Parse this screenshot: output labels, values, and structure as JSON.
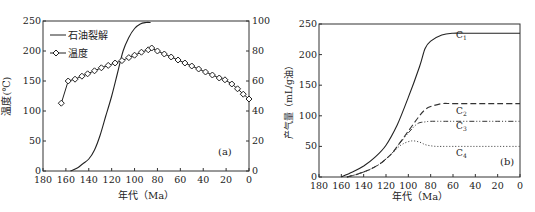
{
  "chart_data": [
    {
      "type": "line",
      "panel_label": "(a)",
      "title": "",
      "xlabel": "年代（Ma）",
      "ylabel": "温度(℃)",
      "ylabel_right": "石油裂解率(%)",
      "xlim": [
        180,
        0
      ],
      "ylim": [
        0,
        250
      ],
      "ylim_right": [
        0,
        100
      ],
      "x_ticks": [
        180,
        160,
        140,
        120,
        100,
        80,
        60,
        40,
        20,
        0
      ],
      "y_ticks": [
        0,
        50,
        100,
        150,
        200,
        250
      ],
      "y_ticks_right": [
        0,
        20,
        40,
        60,
        80,
        100
      ],
      "legend": [
        "石油裂解",
        "温度"
      ],
      "legend_position": "upper left",
      "series": [
        {
          "name": "石油裂解",
          "axis": "right",
          "style": "solid",
          "x": [
            156,
            150,
            145,
            140,
            135,
            130,
            125,
            120,
            115,
            110,
            105,
            100,
            95,
            90,
            86
          ],
          "values": [
            0,
            2,
            5,
            8,
            14,
            24,
            37,
            50,
            65,
            80,
            89,
            95,
            98,
            99,
            99
          ]
        },
        {
          "name": "温度",
          "axis": "left",
          "style": "solid-diamond-markers",
          "x": [
            164,
            158,
            152,
            146,
            141,
            135,
            129,
            123,
            117,
            111,
            105,
            100,
            94,
            88,
            85,
            80,
            74,
            68,
            62,
            56,
            50,
            44,
            38,
            32,
            26,
            21,
            15,
            10,
            5,
            0
          ],
          "values": [
            113,
            150,
            153,
            158,
            162,
            167,
            172,
            176,
            180,
            184,
            189,
            193,
            198,
            202,
            205,
            200,
            195,
            190,
            185,
            180,
            175,
            170,
            165,
            160,
            155,
            152,
            145,
            137,
            128,
            120
          ]
        }
      ]
    },
    {
      "type": "line",
      "panel_label": "(b)",
      "title": "",
      "xlabel": "年代（Ma）",
      "ylabel": "产气量（mL/g油）",
      "xlim": [
        180,
        0
      ],
      "ylim": [
        0,
        250
      ],
      "x_ticks": [
        180,
        160,
        140,
        120,
        100,
        80,
        60,
        40,
        20,
        0
      ],
      "y_ticks": [
        0,
        50,
        100,
        150,
        200,
        250
      ],
      "series": [
        {
          "name": "C1",
          "style": "solid",
          "x": [
            160,
            150,
            140,
            130,
            120,
            110,
            100,
            90,
            85,
            80,
            70,
            60,
            50,
            40,
            20,
            0
          ],
          "values": [
            0,
            8,
            18,
            32,
            52,
            85,
            130,
            180,
            210,
            222,
            232,
            235,
            235,
            235,
            235,
            235
          ]
        },
        {
          "name": "C2",
          "style": "dashed",
          "x": [
            155,
            145,
            135,
            125,
            115,
            110,
            100,
            90,
            85,
            80,
            70,
            60,
            40,
            20,
            0
          ],
          "values": [
            0,
            5,
            12,
            22,
            38,
            50,
            75,
            100,
            110,
            115,
            120,
            120,
            120,
            120,
            120
          ]
        },
        {
          "name": "C3",
          "style": "dash-dot-dot",
          "x": [
            155,
            145,
            135,
            125,
            115,
            110,
            100,
            92,
            85,
            80,
            70,
            60,
            40,
            20,
            0
          ],
          "values": [
            0,
            5,
            12,
            22,
            38,
            50,
            72,
            87,
            90,
            91,
            91,
            91,
            91,
            91,
            91
          ]
        },
        {
          "name": "C4",
          "style": "dotted",
          "x": [
            155,
            145,
            135,
            125,
            115,
            110,
            105,
            97,
            90,
            85,
            80,
            75,
            70,
            60,
            40,
            20,
            0
          ],
          "values": [
            0,
            5,
            12,
            22,
            38,
            47,
            54,
            59,
            57,
            53,
            51,
            50,
            50,
            50,
            50,
            50,
            50
          ]
        }
      ]
    }
  ],
  "panels": {
    "a": {
      "label": "(a)",
      "xlabel": "年代（Ma）",
      "ylabel": "温度(℃)",
      "ylabel_right": "石油裂解率(%)",
      "legend": {
        "oil": "石油裂解",
        "temp": "温度"
      }
    },
    "b": {
      "label": "(b)",
      "xlabel": "年代（Ma）",
      "ylabel": "产气量（mL/g油）",
      "curve_labels": {
        "c1": "C",
        "c1_sub": "1",
        "c2": "C",
        "c2_sub": "2",
        "c3": "C",
        "c3_sub": "3",
        "c4": "C",
        "c4_sub": "4"
      }
    }
  },
  "colors": {
    "line": "#222222",
    "frame": "#333333",
    "background": "#ffffff"
  }
}
